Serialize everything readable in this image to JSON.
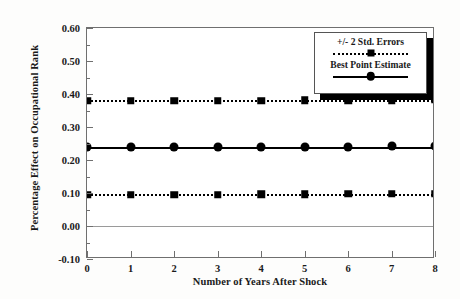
{
  "chart_data": {
    "type": "line",
    "title": "",
    "xlabel": "Number of Years After Shock",
    "ylabel": "Percentage Effect on Occupational Rank",
    "x": [
      0,
      1,
      2,
      3,
      4,
      5,
      6,
      7,
      8
    ],
    "xlim": [
      0,
      8
    ],
    "ylim": [
      -0.1,
      0.6
    ],
    "xticks": [
      "0",
      "1",
      "2",
      "3",
      "4",
      "5",
      "6",
      "7",
      "8"
    ],
    "yticks": [
      "0.60",
      "0.50",
      "0.40",
      "0.30",
      "0.20",
      "0.10",
      "0.00",
      "-0.10"
    ],
    "ytick_values": [
      0.6,
      0.5,
      0.4,
      0.3,
      0.2,
      0.1,
      0.0,
      -0.1
    ],
    "grid": false,
    "legend_position": "top-right",
    "zero_reference_line": 0.0,
    "series": [
      {
        "name": "+/- 2 Std. Errors (upper)",
        "style": "dotted",
        "marker": "square",
        "values": [
          0.38,
          0.38,
          0.38,
          0.38,
          0.38,
          0.381,
          0.381,
          0.381,
          0.382
        ]
      },
      {
        "name": "Best Point Estimate",
        "style": "solid",
        "marker": "circle",
        "values": [
          0.238,
          0.238,
          0.239,
          0.239,
          0.239,
          0.24,
          0.24,
          0.241,
          0.241
        ]
      },
      {
        "name": "+/- 2 Std. Errors (lower)",
        "style": "dotted",
        "marker": "square",
        "values": [
          0.095,
          0.095,
          0.095,
          0.095,
          0.096,
          0.096,
          0.097,
          0.097,
          0.098
        ]
      }
    ],
    "legend": [
      {
        "label": "+/- 2 Std. Errors",
        "style": "dotted",
        "marker": "square"
      },
      {
        "label": "Best Point Estimate",
        "style": "solid",
        "marker": "circle"
      }
    ],
    "colors": {
      "series": "#000000",
      "frame": "#6f6f6f",
      "zero_line": "#9a9a9a",
      "background": "#ffffff"
    }
  }
}
